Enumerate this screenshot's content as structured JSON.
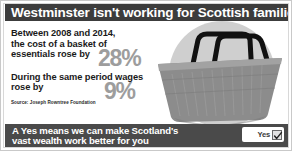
{
  "headline": {
    "text": "Westminster isn't working for Scottish families"
  },
  "stats": [
    {
      "lead": "Between 2008 and 2014,",
      "line2": "the cost of a basket of",
      "line3": "essentials rose by",
      "value": "28%"
    },
    {
      "line1": "During the same period wages",
      "line2": "rose by",
      "value": "9%"
    }
  ],
  "source": "Source: Joseph Rowntree Foundation",
  "footer": {
    "line1": "A Yes means we can make Scotland's",
    "line2": "vast wealth work better for you",
    "yes_label": "Yes",
    "checkbox_state": "checked"
  },
  "artwork": {
    "name": "shopping-basket",
    "description": "grey shopping basket with black handles on light grey circle"
  },
  "colors": {
    "headline_bar": "#3c3c3c",
    "footer_bar": "#4a4a4a",
    "percent_text": "#9d9d9d",
    "body_text": "#1a1a1a",
    "page_bg": "#ffffff",
    "basket_body": "#8c8c8c",
    "basket_handle": "#111111",
    "circle_bg": "#cfcfcf"
  }
}
